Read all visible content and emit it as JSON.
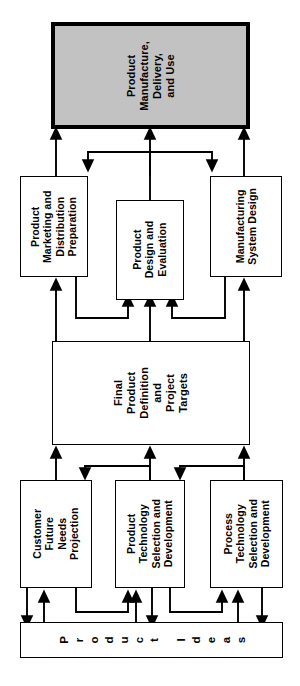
{
  "figure": {
    "type": "flow-diagram",
    "orientation": "rotated-90-ccw",
    "background": "#ffffff",
    "shaded_fill": "#c2c2c2",
    "line_color": "#000000"
  },
  "nodes": {
    "manufacture": {
      "label": "Product\nManufacture,\nDelivery,\nand Use",
      "shaded": true
    },
    "marketing": {
      "label": "Product\nMarketing and\nDistribution\nPreparation",
      "shaded": false
    },
    "design": {
      "label": "Product\nDesign and\nEvaluation",
      "shaded": false
    },
    "mfg_system": {
      "label": "Manufacturing\nSystem Design",
      "shaded": false
    },
    "final_def": {
      "label": "Final\nProduct\nDefinition\nand\nProject\nTargets",
      "shaded": false
    },
    "customer": {
      "label": "Customer\nFuture\nNeeds\nProjection",
      "shaded": false
    },
    "prod_tech": {
      "label": "Product\nTechnology\nSelection and\nDevelopment",
      "shaded": false
    },
    "proc_tech": {
      "label": "Process\nTechnology\nSelection and\nDevelopment",
      "shaded": false
    },
    "ideas": {
      "label": "Product Ideas",
      "letters": [
        "P",
        "r",
        "o",
        "d",
        "u",
        "c",
        "t",
        " ",
        "I",
        "d",
        "e",
        "a",
        "s"
      ],
      "shaded": false
    }
  }
}
